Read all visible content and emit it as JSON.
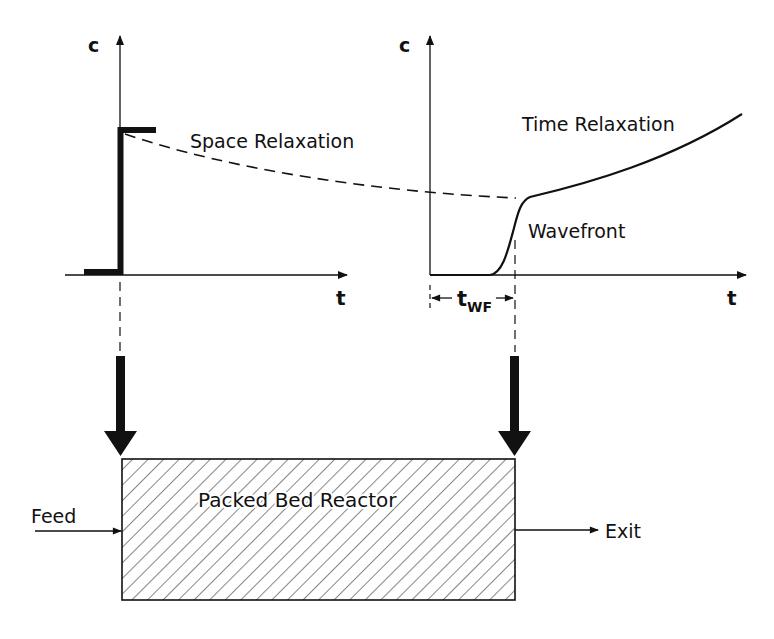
{
  "left_plot": {
    "y_label": "c",
    "x_label": "t",
    "annotation": "Space Relaxation"
  },
  "right_plot": {
    "y_label": "c",
    "x_label": "t",
    "annotation_top": "Time Relaxation",
    "annotation_front": "Wavefront",
    "interval_label_main": "t",
    "interval_label_sub": "WF"
  },
  "reactor": {
    "title": "Packed Bed Reactor",
    "inlet_label": "Feed",
    "outlet_label": "Exit"
  },
  "colors": {
    "ink": "#111111",
    "background": "#ffffff"
  }
}
